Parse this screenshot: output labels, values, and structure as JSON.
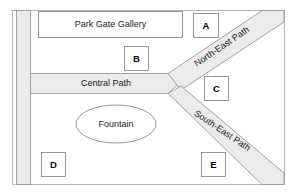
{
  "map": {
    "frame": {
      "border_color": "#b5b5b5",
      "background": "#ffffff"
    },
    "path_fill": "#ebebeb",
    "path_stroke": "#9a9a9a",
    "building": {
      "name": "Park Gate Gallery",
      "fill": "#ffffff",
      "stroke": "#8c8c8c"
    },
    "feature": {
      "name": "Fountain",
      "shape": "ellipse",
      "fill": "#ffffff",
      "stroke": "#8c8c8c"
    },
    "paths": [
      {
        "id": "west-path",
        "name": "",
        "orientation": "vertical"
      },
      {
        "id": "central-path",
        "name": "Central Path",
        "orientation": "horizontal"
      },
      {
        "id": "north-east-path",
        "name": "North-East Path",
        "orientation": "diagonal-up"
      },
      {
        "id": "south-east-path",
        "name": "South-East Path",
        "orientation": "diagonal-down"
      }
    ],
    "markers": [
      {
        "id": "marker-a",
        "label": "A"
      },
      {
        "id": "marker-b",
        "label": "B"
      },
      {
        "id": "marker-c",
        "label": "C"
      },
      {
        "id": "marker-d",
        "label": "D"
      },
      {
        "id": "marker-e",
        "label": "E"
      }
    ]
  }
}
